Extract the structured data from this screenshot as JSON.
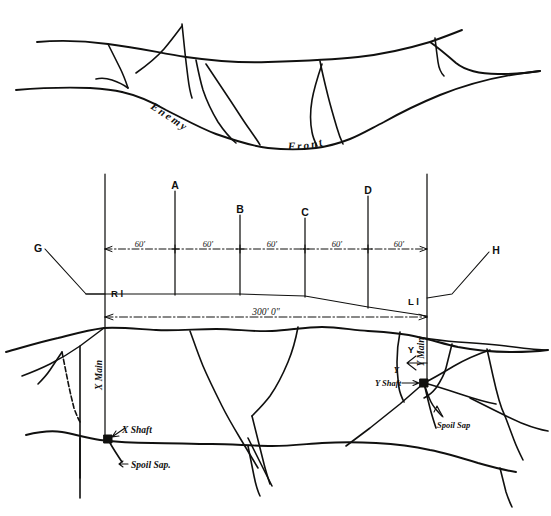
{
  "diagram": {
    "ink_color": "#10100f",
    "background": "#ffffff"
  },
  "upper_plan": {
    "name": "enemy-front-trench-plan",
    "labels": {
      "enemy": "Enemy",
      "front": "Front"
    }
  },
  "lower_plan": {
    "name": "mine-system-plan",
    "endpoints": {
      "left_label": "G",
      "right_label": "H"
    },
    "limits": {
      "right_limit": "R l",
      "left_limit": "L l"
    },
    "gallery_labels": [
      "A",
      "B",
      "C",
      "D"
    ],
    "spacing_values": [
      "60'",
      "60'",
      "60'",
      "60'",
      "60'"
    ],
    "overall_dimension": "300' 0\"",
    "x_side": {
      "main_label": "X Main",
      "shaft_label": "X Shaft",
      "spoil_label": "Spoil Sap."
    },
    "y_side": {
      "main_label": "Y Main",
      "shaft_tick": "Y",
      "shaft_label": "Y Shaft",
      "spoil_label": "Spoil Sap"
    }
  }
}
